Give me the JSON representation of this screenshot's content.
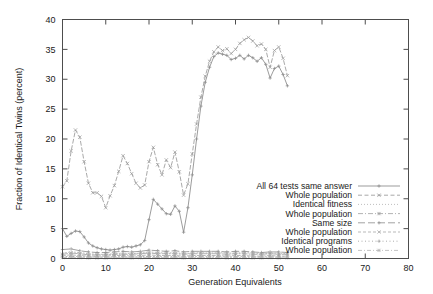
{
  "chart_data": {
    "type": "line",
    "title": "",
    "xlabel": "Generation Equivalents",
    "ylabel": "Fraction of Identical Twins (percent)",
    "xlim": [
      0,
      80
    ],
    "ylim": [
      0,
      40
    ],
    "xticks": [
      0,
      10,
      20,
      30,
      40,
      50,
      60,
      70,
      80
    ],
    "yticks": [
      0,
      5,
      10,
      15,
      20,
      25,
      30,
      35,
      40
    ],
    "grid": false,
    "legend_position": "inside lower-right",
    "series": [
      {
        "name": "All 64 tests same answer",
        "color": "#8a8a8a",
        "dash": "none",
        "marker": "plus",
        "x": [
          0,
          1,
          2,
          3,
          4,
          5,
          6,
          7,
          8,
          9,
          10,
          11,
          12,
          13,
          14,
          15,
          16,
          17,
          18,
          19,
          20,
          21,
          22,
          23,
          24,
          25,
          26,
          27,
          28,
          29,
          30,
          31,
          32,
          33,
          34,
          35,
          36,
          37,
          38,
          39,
          40,
          41,
          42,
          43,
          44,
          45,
          46,
          47,
          48,
          49,
          50,
          51,
          52
        ],
        "y": [
          5.0,
          3.7,
          4.2,
          4.6,
          4.5,
          3.6,
          2.6,
          2.1,
          1.8,
          1.6,
          1.5,
          1.4,
          1.5,
          1.6,
          1.9,
          2.0,
          1.9,
          2.1,
          2.3,
          3.0,
          6.5,
          9.9,
          9.1,
          8.3,
          7.5,
          7.4,
          8.8,
          7.9,
          4.4,
          8.5,
          14.0,
          20.0,
          25.5,
          29.5,
          32.0,
          33.8,
          34.4,
          34.2,
          34.0,
          33.3,
          33.5,
          34.0,
          33.4,
          34.0,
          33.6,
          33.0,
          33.6,
          32.5,
          30.2,
          31.8,
          32.2,
          30.8,
          28.9
        ]
      },
      {
        "name": "Whole population",
        "color": "#9a9a9a",
        "dash": "dashed",
        "marker": "cross",
        "x": [
          0,
          1,
          2,
          3,
          4,
          5,
          6,
          7,
          8,
          9,
          10,
          11,
          12,
          13,
          14,
          15,
          16,
          17,
          18,
          19,
          20,
          21,
          22,
          23,
          24,
          25,
          26,
          27,
          28,
          29,
          30,
          31,
          32,
          33,
          34,
          35,
          36,
          37,
          38,
          39,
          40,
          41,
          42,
          43,
          44,
          45,
          46,
          47,
          48,
          49,
          50,
          51,
          52
        ],
        "y": [
          12.0,
          13.0,
          18.0,
          21.5,
          20.3,
          16.2,
          12.6,
          11.0,
          11.0,
          10.4,
          8.5,
          10.5,
          12.2,
          14.6,
          17.2,
          15.9,
          14.2,
          12.6,
          11.8,
          12.3,
          16.2,
          18.6,
          15.7,
          14.0,
          16.5,
          15.2,
          17.8,
          14.5,
          10.6,
          12.5,
          17.5,
          22.5,
          27.0,
          30.5,
          33.0,
          34.6,
          35.4,
          34.8,
          35.1,
          34.3,
          35.0,
          36.0,
          36.6,
          37.0,
          36.4,
          35.6,
          35.9,
          35.0,
          32.0,
          34.8,
          35.4,
          33.5,
          30.6
        ]
      },
      {
        "name": "Identical fitness",
        "color": "#b4b4b4",
        "dash": "dotted",
        "marker": "none",
        "x": [
          0,
          2,
          4,
          6,
          8,
          10,
          12,
          14,
          16,
          18,
          20,
          22,
          24,
          26,
          28,
          30,
          32,
          34,
          36,
          38,
          40,
          42,
          44,
          46,
          48,
          50,
          52
        ],
        "y": [
          0.9,
          1.1,
          1.0,
          0.8,
          0.7,
          0.7,
          0.8,
          0.9,
          0.8,
          0.9,
          1.1,
          1.0,
          0.9,
          1.0,
          0.8,
          0.9,
          1.0,
          0.9,
          1.0,
          0.9,
          0.9,
          1.0,
          0.9,
          0.8,
          0.9,
          0.9,
          0.8
        ]
      },
      {
        "name": "Whole population",
        "color": "#a5a5a5",
        "dash": "dashdot",
        "marker": "star",
        "x": [
          0,
          2,
          4,
          6,
          8,
          10,
          12,
          14,
          16,
          18,
          20,
          22,
          24,
          26,
          28,
          30,
          32,
          34,
          36,
          38,
          40,
          42,
          44,
          46,
          48,
          50,
          52
        ],
        "y": [
          0.7,
          0.9,
          0.8,
          0.6,
          0.6,
          0.6,
          0.7,
          0.7,
          0.7,
          0.8,
          0.9,
          0.8,
          0.8,
          0.8,
          0.7,
          0.8,
          0.8,
          0.8,
          0.8,
          0.7,
          0.8,
          0.8,
          0.7,
          0.7,
          0.8,
          0.7,
          0.7
        ]
      },
      {
        "name": "Same size",
        "color": "#919191",
        "dash": "longdash",
        "marker": "plus",
        "x": [
          0,
          2,
          4,
          6,
          8,
          10,
          12,
          14,
          16,
          18,
          20,
          22,
          24,
          26,
          28,
          30,
          32,
          34,
          36,
          38,
          40,
          42,
          44,
          46,
          48,
          50,
          52
        ],
        "y": [
          1.5,
          1.6,
          1.3,
          1.1,
          1.0,
          1.0,
          1.1,
          1.2,
          1.1,
          1.2,
          1.4,
          1.3,
          1.2,
          1.3,
          1.1,
          1.2,
          1.2,
          1.2,
          1.2,
          1.1,
          1.2,
          1.2,
          1.1,
          1.0,
          1.1,
          1.1,
          1.0
        ]
      },
      {
        "name": "Whole population",
        "color": "#acacac",
        "dash": "dashed2",
        "marker": "cross",
        "x": [
          0,
          2,
          4,
          6,
          8,
          10,
          12,
          14,
          16,
          18,
          20,
          22,
          24,
          26,
          28,
          30,
          32,
          34,
          36,
          38,
          40,
          42,
          44,
          46,
          48,
          50,
          52
        ],
        "y": [
          0.5,
          0.6,
          0.5,
          0.4,
          0.4,
          0.4,
          0.5,
          0.5,
          0.4,
          0.5,
          0.6,
          0.5,
          0.5,
          0.5,
          0.4,
          0.5,
          0.5,
          0.5,
          0.5,
          0.4,
          0.5,
          0.5,
          0.4,
          0.4,
          0.5,
          0.4,
          0.4
        ]
      },
      {
        "name": "Identical programs",
        "color": "#9e9e9e",
        "dash": "dotted2",
        "marker": "plus",
        "x": [
          0,
          2,
          4,
          6,
          8,
          10,
          12,
          14,
          16,
          18,
          20,
          22,
          24,
          26,
          28,
          30,
          32,
          34,
          36,
          38,
          40,
          42,
          44,
          46,
          48,
          50,
          52
        ],
        "y": [
          0.3,
          0.35,
          0.3,
          0.25,
          0.25,
          0.25,
          0.3,
          0.3,
          0.25,
          0.3,
          0.35,
          0.3,
          0.3,
          0.3,
          0.25,
          0.3,
          0.3,
          0.3,
          0.3,
          0.25,
          0.3,
          0.3,
          0.25,
          0.25,
          0.3,
          0.25,
          0.25
        ]
      },
      {
        "name": "Whole population",
        "color": "#b8b8b8",
        "dash": "dashdot2",
        "marker": "star",
        "x": [
          0,
          2,
          4,
          6,
          8,
          10,
          12,
          14,
          16,
          18,
          20,
          22,
          24,
          26,
          28,
          30,
          32,
          34,
          36,
          38,
          40,
          42,
          44,
          46,
          48,
          50,
          52
        ],
        "y": [
          0.15,
          0.2,
          0.15,
          0.1,
          0.1,
          0.1,
          0.15,
          0.15,
          0.1,
          0.15,
          0.2,
          0.15,
          0.15,
          0.15,
          0.1,
          0.15,
          0.15,
          0.15,
          0.15,
          0.1,
          0.15,
          0.15,
          0.1,
          0.1,
          0.15,
          0.1,
          0.1
        ]
      }
    ]
  },
  "axes": {
    "x_title": "Generation Equivalents",
    "y_title": "Fraction of Identical Twins (percent)",
    "x_tick_labels": [
      "0",
      "10",
      "20",
      "30",
      "40",
      "50",
      "60",
      "70",
      "80"
    ],
    "y_tick_labels": [
      "0",
      "5",
      "10",
      "15",
      "20",
      "25",
      "30",
      "35",
      "40"
    ]
  },
  "legend": {
    "entries": [
      "All 64 tests same answer",
      "Whole population",
      "Identical fitness",
      "Whole population",
      "Same size",
      "Whole population",
      "Identical programs",
      "Whole population"
    ]
  },
  "colors": {
    "background": "#ffffff",
    "axis": "#4d4d4d",
    "text": "#1a1a1a",
    "series_gray": "#9a9a9a"
  }
}
